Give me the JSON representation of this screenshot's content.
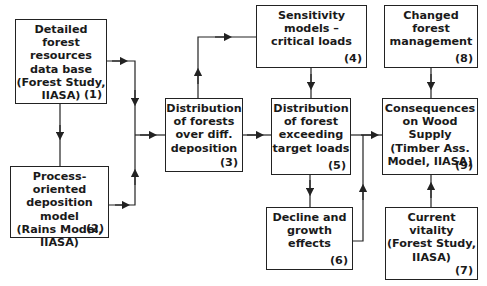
{
  "diagram": {
    "boxes": [
      {
        "id": "1",
        "text": "Detailed\nforest resources\ndata base\n(Forest Study,\nIIASA)",
        "number": "(1)"
      },
      {
        "id": "2",
        "text": "Process-oriented\ndeposition model\n(Rains Model,\nIIASA)",
        "number": "(2)"
      },
      {
        "id": "3",
        "text": "Distribution\nof forests\nover diff.\ndeposition",
        "number": "(3)"
      },
      {
        "id": "4",
        "text": "Sensitivity models –\ncritical loads",
        "number": "(4)"
      },
      {
        "id": "5",
        "text": "Distribution\nof forest\nexceeding\ntarget loads",
        "number": "(5)"
      },
      {
        "id": "6",
        "text": "Decline and\ngrowth effects",
        "number": "(6)"
      },
      {
        "id": "7",
        "text": "Current\nvitality\n(Forest Study,\nIIASA)",
        "number": "(7)"
      },
      {
        "id": "8",
        "text": "Changed forest\nmanagement",
        "number": "(8)"
      },
      {
        "id": "9",
        "text": "Consequences\non Wood Supply\n(Timber Ass.\nModel, IIASA)",
        "number": "(9)"
      }
    ],
    "edges": [
      {
        "from": "1",
        "to": "2"
      },
      {
        "from": "1",
        "to": "3"
      },
      {
        "from": "2",
        "to": "3"
      },
      {
        "from": "3",
        "to": "4"
      },
      {
        "from": "3",
        "to": "5"
      },
      {
        "from": "4",
        "to": "5"
      },
      {
        "from": "5",
        "to": "6"
      },
      {
        "from": "5",
        "to": "9"
      },
      {
        "from": "6",
        "to": "9"
      },
      {
        "from": "8",
        "to": "9"
      },
      {
        "from": "7",
        "to": "9"
      }
    ],
    "colors": {
      "line": "#222222",
      "background": "#ffffff"
    }
  }
}
